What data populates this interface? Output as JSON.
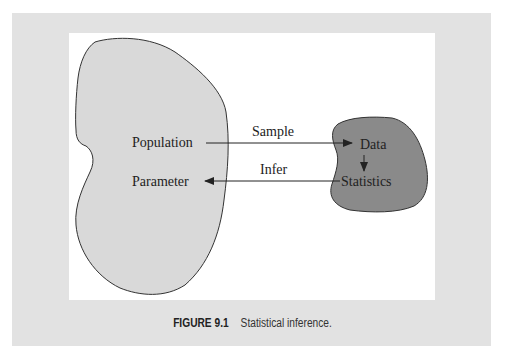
{
  "figure": {
    "number": "FIGURE 9.1",
    "caption": "Statistical inference."
  },
  "diagram": {
    "population_blob": {
      "fill": "#d9d9d9",
      "labels": {
        "top": "Population",
        "bottom": "Parameter"
      }
    },
    "sample_blob": {
      "fill": "#8a8a8a",
      "labels": {
        "top": "Data",
        "bottom": "Statistics"
      }
    },
    "arrows": [
      {
        "from": "Population",
        "to": "Data",
        "label": "Sample"
      },
      {
        "from": "Statistics",
        "to": "Parameter",
        "label": "Infer"
      },
      {
        "from": "Data",
        "to": "Statistics",
        "label": ""
      }
    ]
  },
  "colors": {
    "outer_panel": "#e2e2e2",
    "inner_panel": "#ffffff",
    "stroke": "#333333"
  }
}
